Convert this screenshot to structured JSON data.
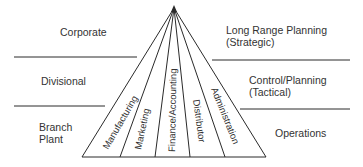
{
  "levels_left": [
    {
      "label": "Corporate"
    },
    {
      "label": "Divisional"
    },
    {
      "label_line1": "Branch",
      "label_line2": "Plant"
    }
  ],
  "levels_right": [
    {
      "label_line1": "Long Range Planning",
      "label_line2": "(Strategic)"
    },
    {
      "label_line1": "Control/Planning",
      "label_line2": "(Tactical)"
    },
    {
      "label": "Operations"
    }
  ],
  "functions": [
    "Manufacturing",
    "Marketing",
    "Finance/Accounting",
    "Distributor",
    "Administration"
  ],
  "colors": {
    "line": "#2a2a2a",
    "text": "#333333",
    "background": "#ffffff"
  }
}
